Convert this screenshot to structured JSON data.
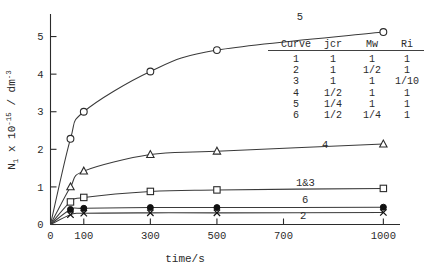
{
  "chart_data": {
    "type": "line",
    "title": "",
    "xlabel": "time/s",
    "ylabel": "N_1 x 10^-15 / dm^-3",
    "ylabel_parts": {
      "symbol": "N",
      "symbol_sub": "1",
      "mult": " x 10",
      "mult_sup": "-15",
      "unit": " / dm",
      "unit_sup": "-3"
    },
    "x_ticks": [
      0,
      100,
      300,
      500,
      700,
      1000
    ],
    "x_tick_labels": [
      "0",
      "100",
      "300",
      "500",
      "700",
      "1000"
    ],
    "y_ticks": [
      0,
      1,
      2,
      3,
      4,
      5
    ],
    "y_tick_labels": [
      "0",
      "1",
      "2",
      "3",
      "4",
      "5"
    ],
    "xlim": [
      0,
      1050
    ],
    "ylim": [
      0,
      5.6
    ],
    "grid": false,
    "legend_position": "inside-right",
    "series": [
      {
        "name": "5",
        "label": "5",
        "marker": "open-circle",
        "x": [
          60,
          100,
          300,
          500,
          1000
        ],
        "y": [
          2.28,
          3.0,
          4.07,
          4.64,
          5.12
        ]
      },
      {
        "name": "4",
        "label": "4",
        "marker": "open-triangle",
        "x": [
          60,
          100,
          300,
          500,
          1000
        ],
        "y": [
          1.0,
          1.42,
          1.86,
          1.95,
          2.14
        ]
      },
      {
        "name": "1&3",
        "label": "1&3",
        "marker": "open-square",
        "x": [
          60,
          100,
          300,
          500,
          1000
        ],
        "y": [
          0.6,
          0.72,
          0.88,
          0.92,
          0.96
        ]
      },
      {
        "name": "6",
        "label": "6",
        "marker": "filled-circle",
        "x": [
          60,
          100,
          300,
          500,
          1000
        ],
        "y": [
          0.4,
          0.43,
          0.45,
          0.45,
          0.46
        ]
      },
      {
        "name": "2",
        "label": "2",
        "marker": "cross-x",
        "x": [
          60,
          100,
          300,
          500,
          1000
        ],
        "y": [
          0.26,
          0.3,
          0.31,
          0.31,
          0.32
        ]
      }
    ]
  },
  "legend_table": {
    "headers": [
      "Curve",
      "jcr",
      "Mw",
      "Ri"
    ],
    "rows": [
      [
        "1",
        "1",
        "1",
        "1"
      ],
      [
        "2",
        "1",
        "1/2",
        "1"
      ],
      [
        "3",
        "1",
        "1",
        "1/10"
      ],
      [
        "4",
        "1/2",
        "1",
        "1"
      ],
      [
        "5",
        "1/4",
        "1",
        "1"
      ],
      [
        "6",
        "1/2",
        "1/4",
        "1"
      ]
    ]
  }
}
